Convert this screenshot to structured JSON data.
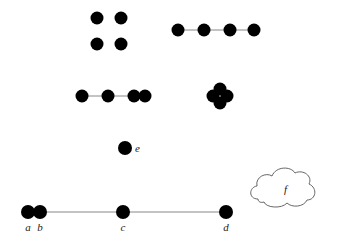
{
  "colors": {
    "dot": "#000000",
    "line": "#888888",
    "cloud_stroke": "#555555",
    "background": "#ffffff"
  },
  "dot_radius": 6.5,
  "groups": [
    {
      "name": "grid-2x2",
      "points": [
        [
          97,
          18
        ],
        [
          121,
          18
        ],
        [
          97,
          44
        ],
        [
          121,
          44
        ]
      ],
      "lines": []
    },
    {
      "name": "row-evenly-spaced",
      "points": [
        [
          178,
          30
        ],
        [
          204,
          30
        ],
        [
          230,
          30
        ],
        [
          254,
          30
        ]
      ],
      "lines": [
        [
          178,
          30,
          254,
          30
        ]
      ]
    },
    {
      "name": "row-with-overlap",
      "points": [
        [
          82,
          96
        ],
        [
          108,
          96
        ],
        [
          134,
          96
        ],
        [
          145,
          96
        ]
      ],
      "lines": [
        [
          82,
          96,
          145,
          96
        ]
      ]
    },
    {
      "name": "cluster-four",
      "points": [
        [
          220,
          89
        ],
        [
          213,
          96
        ],
        [
          227,
          96
        ],
        [
          220,
          103
        ]
      ],
      "lines": []
    }
  ],
  "single_point": {
    "label": "e",
    "x": 125,
    "y": 148
  },
  "number_line": {
    "x1": 28,
    "x2": 226,
    "y": 212,
    "points": [
      {
        "label": "a",
        "x": 28
      },
      {
        "label": "b",
        "x": 40
      },
      {
        "label": "c",
        "x": 123
      },
      {
        "label": "d",
        "x": 226
      }
    ]
  },
  "cloud": {
    "label": "f",
    "cx": 285,
    "cy": 185
  }
}
